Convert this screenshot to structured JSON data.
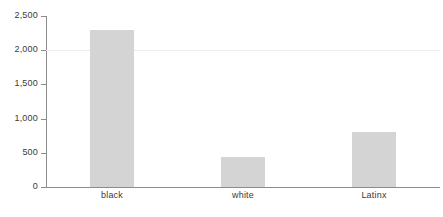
{
  "chart_data": {
    "type": "bar",
    "title": "",
    "subtitle": "",
    "xlabel": "",
    "ylabel": "",
    "categories": [
      "black",
      "white",
      "Latinx"
    ],
    "values": [
      2300,
      440,
      810
    ],
    "series": [
      {
        "name": "count",
        "values": [
          2300,
          440,
          810
        ]
      }
    ],
    "ylim": [
      0,
      2500
    ],
    "y_ticks": [
      0,
      500,
      1000,
      1500,
      2000,
      2500
    ],
    "y_tick_labels": [
      "0",
      "500",
      "1,000",
      "1,500",
      "2,000",
      "2,500"
    ],
    "gridlines": [
      2000
    ],
    "grid": "horizontal-faint",
    "legend": "none",
    "bar_color": "#d4d4d4",
    "axis_color": "#8c8c8c",
    "grid_color": "#ececed",
    "text_color": "#3a3a3a",
    "background": "#ffffff"
  }
}
